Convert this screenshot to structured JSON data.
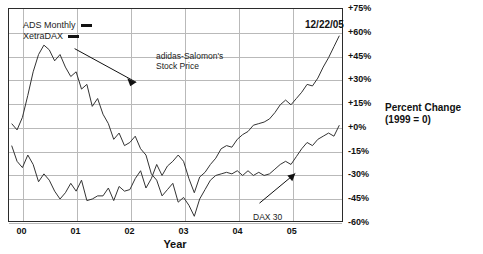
{
  "clipped_top_text": "",
  "legend": {
    "items": [
      {
        "label": "ADS Monthly",
        "marker": "line-marker",
        "color": "#111111"
      },
      {
        "label": "XetraDAX",
        "marker": "line-marker",
        "color": "#111111"
      }
    ]
  },
  "date_stamp": "12/22/05",
  "axis_title_right": {
    "line1": "Percent Change",
    "line2": "(1999 = 0)"
  },
  "annotations": [
    {
      "id": "ads",
      "line1": "adidas-Salomon's",
      "line2": "Stock Price"
    },
    {
      "id": "dax",
      "line1": "DAX 30",
      "line2": ""
    }
  ],
  "chart_data": {
    "type": "line",
    "title": "",
    "subtitle": "",
    "xlabel": "Year",
    "ylabel": "Percent Change (1999 = 0)",
    "xlim": [
      1999.75,
      2005.95
    ],
    "ylim": [
      -60,
      75
    ],
    "yticks": [
      75,
      60,
      45,
      30,
      15,
      0,
      -15,
      -30,
      -45,
      -60
    ],
    "ytick_labels": [
      "+75%",
      "+60%",
      "+45%",
      "+30%",
      "+15%",
      "+0%",
      "-15%",
      "-30%",
      "-45%",
      "-60%"
    ],
    "xticks": [
      2000,
      2001,
      2002,
      2003,
      2004,
      2005
    ],
    "xtick_labels": [
      "00",
      "01",
      "02",
      "03",
      "04",
      "05"
    ],
    "grid": true,
    "legend_position": "top-left",
    "series": [
      {
        "name": "ADS Monthly",
        "label": "adidas-Salomon's Stock Price",
        "color": "#333333",
        "x": [
          1999.8,
          1999.9,
          2000.0,
          2000.1,
          2000.2,
          2000.3,
          2000.4,
          2000.5,
          2000.6,
          2000.7,
          2000.8,
          2000.9,
          2001.0,
          2001.1,
          2001.2,
          2001.3,
          2001.4,
          2001.5,
          2001.6,
          2001.7,
          2001.8,
          2001.9,
          2002.0,
          2002.1,
          2002.2,
          2002.3,
          2002.4,
          2002.5,
          2002.6,
          2002.7,
          2002.8,
          2002.9,
          2003.0,
          2003.1,
          2003.2,
          2003.3,
          2003.4,
          2003.5,
          2003.6,
          2003.7,
          2003.8,
          2003.9,
          2004.0,
          2004.1,
          2004.2,
          2004.3,
          2004.4,
          2004.5,
          2004.6,
          2004.7,
          2004.8,
          2004.9,
          2005.0,
          2005.1,
          2005.2,
          2005.3,
          2005.4,
          2005.5,
          2005.6,
          2005.7,
          2005.8,
          2005.9
        ],
        "y": [
          -12,
          -22,
          -26,
          -18,
          -24,
          -35,
          -30,
          -34,
          -41,
          -46,
          -42,
          -36,
          -41,
          -34,
          -47,
          -46,
          -44,
          -44,
          -39,
          -47,
          -38,
          -41,
          -40,
          -33,
          -28,
          -39,
          -33,
          -24,
          -31,
          -25,
          -22,
          -18,
          -22,
          -33,
          -42,
          -32,
          -29,
          -24,
          -20,
          -14,
          -12,
          -13,
          -8,
          -5,
          -3,
          1,
          2,
          3,
          5,
          9,
          14,
          17,
          14,
          18,
          22,
          27,
          26,
          31,
          38,
          44,
          51,
          58
        ]
      },
      {
        "name": "XetraDAX",
        "label": "DAX 30",
        "color": "#333333",
        "x": [
          1999.8,
          1999.9,
          2000.0,
          2000.1,
          2000.2,
          2000.3,
          2000.4,
          2000.5,
          2000.6,
          2000.7,
          2000.8,
          2000.9,
          2001.0,
          2001.1,
          2001.2,
          2001.3,
          2001.4,
          2001.5,
          2001.6,
          2001.7,
          2001.8,
          2001.9,
          2002.0,
          2002.1,
          2002.2,
          2002.3,
          2002.4,
          2002.5,
          2002.6,
          2002.7,
          2002.8,
          2002.9,
          2003.0,
          2003.1,
          2003.2,
          2003.3,
          2003.4,
          2003.5,
          2003.6,
          2003.7,
          2003.8,
          2003.9,
          2004.0,
          2004.1,
          2004.2,
          2004.3,
          2004.4,
          2004.5,
          2004.6,
          2004.7,
          2004.8,
          2004.9,
          2005.0,
          2005.1,
          2005.2,
          2005.3,
          2005.4,
          2005.5,
          2005.6,
          2005.7,
          2005.8,
          2005.9
        ],
        "y": [
          2,
          -2,
          6,
          20,
          35,
          46,
          52,
          49,
          42,
          46,
          38,
          32,
          35,
          24,
          27,
          13,
          18,
          8,
          2,
          -8,
          -4,
          -12,
          -10,
          -6,
          -14,
          -18,
          -30,
          -34,
          -44,
          -40,
          -36,
          -48,
          -45,
          -50,
          -57,
          -46,
          -40,
          -34,
          -31,
          -30,
          -29,
          -30,
          -28,
          -31,
          -28,
          -31,
          -29,
          -31,
          -30,
          -27,
          -24,
          -22,
          -24,
          -19,
          -14,
          -10,
          -12,
          -8,
          -6,
          -4,
          -6,
          1
        ]
      }
    ]
  }
}
